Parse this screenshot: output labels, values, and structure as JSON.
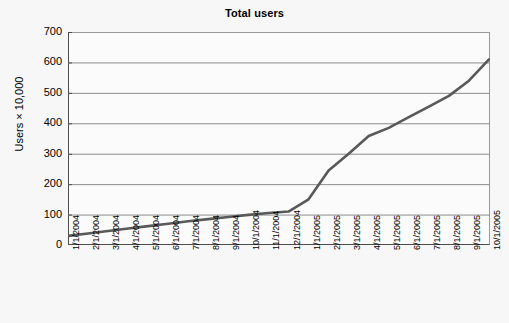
{
  "chart_data": {
    "type": "line",
    "title": "Total users",
    "xlabel": "",
    "ylabel": "Users × 10,000",
    "ylim": [
      0,
      700
    ],
    "ytick_step": 100,
    "yticks": [
      0,
      100,
      200,
      300,
      400,
      500,
      600,
      700
    ],
    "grid": true,
    "legend": "none",
    "line_color": "#595959",
    "categories": [
      "1/1/2004",
      "2/1/2004",
      "3/1/2004",
      "4/1/2004",
      "5/1/2004",
      "6/1/2004",
      "7/1/2004",
      "8/1/2004",
      "9/1/2004",
      "10/1/2004",
      "11/1/2004",
      "12/1/2004",
      "1/1/2005",
      "2/1/2005",
      "3/1/2005",
      "4/1/2005",
      "5/1/2005",
      "6/1/2005",
      "7/1/2005",
      "8/1/2005",
      "9/1/2005",
      "10/1/2005"
    ],
    "values": [
      30,
      38,
      46,
      54,
      62,
      70,
      78,
      85,
      92,
      99,
      105,
      110,
      150,
      245,
      300,
      358,
      385,
      420,
      455,
      490,
      540,
      610
    ],
    "series": [
      {
        "name": "Total users",
        "values": [
          30,
          38,
          46,
          54,
          62,
          70,
          78,
          85,
          92,
          99,
          105,
          110,
          150,
          245,
          300,
          358,
          385,
          420,
          455,
          490,
          540,
          610
        ]
      }
    ]
  },
  "axes": {
    "y_tick_labels": [
      "700",
      "600",
      "500",
      "400",
      "300",
      "200",
      "100",
      "0"
    ],
    "y_title": "Users × 10,000",
    "x_tick_labels": [
      "1/1/2004",
      "2/1/2004",
      "3/1/2004",
      "4/1/2004",
      "5/1/2004",
      "6/1/2004",
      "7/1/2004",
      "8/1/2004",
      "9/1/2004",
      "10/1/2004",
      "11/1/2004",
      "12/1/2004",
      "1/1/2005",
      "2/1/2005",
      "3/1/2005",
      "4/1/2005",
      "5/1/2005",
      "6/1/2005",
      "7/1/2005",
      "8/1/2005",
      "9/1/2005",
      "10/1/2005"
    ]
  },
  "colors": {
    "line": "#595959",
    "grid": "#8c8c8c",
    "axis": "#4d4d4d",
    "background": "#f7f7f7",
    "plot_background": "#fbfbfb"
  }
}
